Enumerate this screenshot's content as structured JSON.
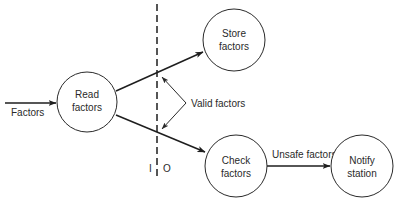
{
  "diagram": {
    "type": "data-flow-diagram",
    "nodes": [
      {
        "id": "read",
        "label_lines": [
          "Read",
          "factors"
        ]
      },
      {
        "id": "store",
        "label_lines": [
          "Store",
          "factors"
        ]
      },
      {
        "id": "check",
        "label_lines": [
          "Check",
          "factors"
        ]
      },
      {
        "id": "notify",
        "label_lines": [
          "Notify",
          "station"
        ]
      }
    ],
    "edges": [
      {
        "from": "external",
        "to": "read",
        "label": "Factors"
      },
      {
        "from": "read",
        "to": "store",
        "label": "Valid factors"
      },
      {
        "from": "read",
        "to": "check",
        "label": "Valid factors"
      },
      {
        "from": "check",
        "to": "notify",
        "label": "Unsafe factors"
      }
    ],
    "boundary": {
      "style": "dashed-vertical",
      "input_side_label": "I",
      "output_side_label": "O"
    },
    "annotations": {
      "valid_factors": "Valid factors"
    },
    "colors": {
      "stroke": "#1e1e1e",
      "text": "#2a2a2a",
      "background": "#ffffff"
    }
  }
}
